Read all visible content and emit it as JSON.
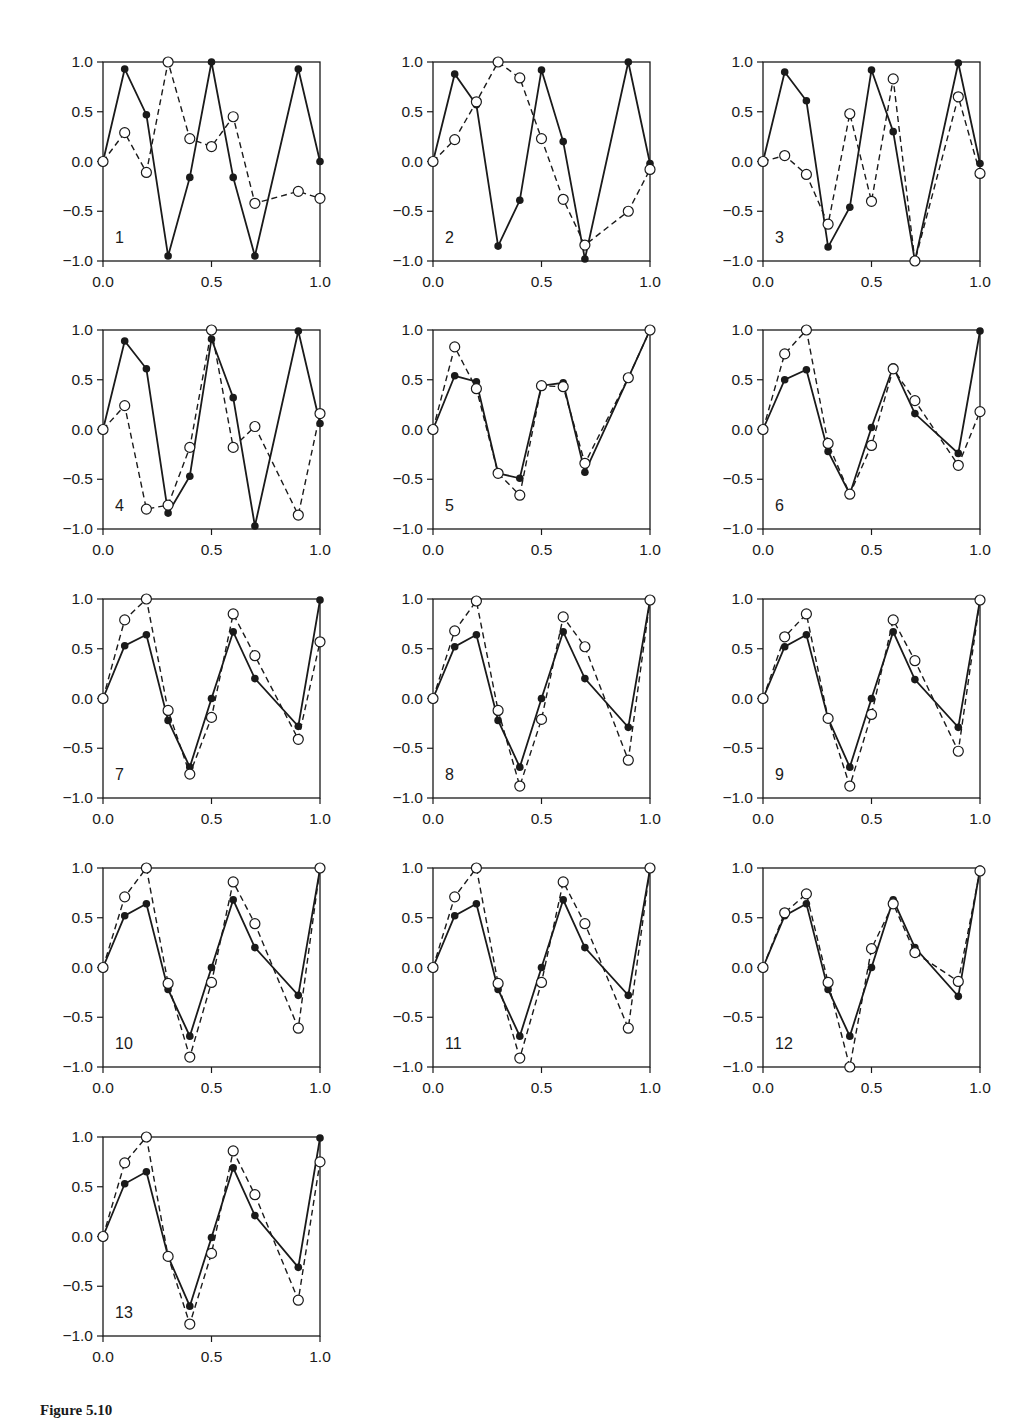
{
  "figure": {
    "caption_label": "Figure 5.10",
    "caption_text": ""
  },
  "chart_data": {
    "type": "line",
    "layout": "5 rows x 3 columns grid of small multiples (13 panels)",
    "series_styles": {
      "solid": {
        "line": "solid",
        "marker": "filled circle",
        "color": "#1a1a1a"
      },
      "dashed": {
        "line": "dashed",
        "marker": "open circle",
        "color": "#1a1a1a"
      }
    },
    "x": [
      0.0,
      0.1,
      0.2,
      0.3,
      0.4,
      0.5,
      0.6,
      0.7,
      0.9,
      1.0
    ],
    "xlim": [
      0.0,
      1.0
    ],
    "ylim": [
      -1.0,
      1.0
    ],
    "xticks": [
      "0.0",
      "0.5",
      "1.0"
    ],
    "yticks": [
      "1.0",
      "0.5",
      "0.0",
      "-0.5",
      "-1.0"
    ],
    "grid": false,
    "legend": "none",
    "panels": [
      {
        "label": "1",
        "solid": [
          0,
          0.93,
          0.47,
          -0.95,
          -0.16,
          1.0,
          -0.16,
          -0.95,
          0.93,
          0.0
        ],
        "dashed": [
          0,
          0.29,
          -0.11,
          1.0,
          0.23,
          0.15,
          0.45,
          -0.42,
          -0.3,
          -0.37
        ]
      },
      {
        "label": "2",
        "solid": [
          0,
          0.88,
          0.57,
          -0.85,
          -0.39,
          0.92,
          0.2,
          -0.98,
          1.0,
          -0.02
        ],
        "dashed": [
          0,
          0.22,
          0.6,
          1.0,
          0.84,
          0.23,
          -0.38,
          -0.84,
          -0.5,
          -0.08
        ]
      },
      {
        "label": "3",
        "solid": [
          0,
          0.9,
          0.61,
          -0.86,
          -0.46,
          0.92,
          0.3,
          -1.0,
          0.99,
          -0.02
        ],
        "dashed": [
          0,
          0.06,
          -0.13,
          -0.63,
          0.48,
          -0.4,
          0.83,
          -1.0,
          0.65,
          -0.12
        ]
      },
      {
        "label": "4",
        "solid": [
          0,
          0.89,
          0.61,
          -0.84,
          -0.47,
          0.91,
          0.32,
          -0.97,
          0.99,
          0.06
        ],
        "dashed": [
          0,
          0.24,
          -0.8,
          -0.76,
          -0.18,
          1.0,
          -0.18,
          0.03,
          -0.86,
          0.16
        ]
      },
      {
        "label": "5",
        "solid": [
          0,
          0.54,
          0.48,
          -0.44,
          -0.49,
          0.44,
          0.47,
          -0.43,
          0.52,
          1.0
        ],
        "dashed": [
          0,
          0.83,
          0.41,
          -0.44,
          -0.66,
          0.44,
          0.43,
          -0.34,
          0.52,
          1.0
        ]
      },
      {
        "label": "6",
        "solid": [
          0,
          0.5,
          0.6,
          -0.22,
          -0.65,
          0.02,
          0.63,
          0.16,
          -0.24,
          0.99
        ],
        "dashed": [
          0,
          0.76,
          1.0,
          -0.14,
          -0.65,
          -0.16,
          0.61,
          0.29,
          -0.36,
          0.18
        ]
      },
      {
        "label": "7",
        "solid": [
          0,
          0.53,
          0.64,
          -0.22,
          -0.69,
          0.0,
          0.67,
          0.2,
          -0.28,
          0.99
        ],
        "dashed": [
          0,
          0.79,
          1.0,
          -0.12,
          -0.76,
          -0.19,
          0.85,
          0.43,
          -0.41,
          0.57
        ]
      },
      {
        "label": "8",
        "solid": [
          0,
          0.52,
          0.64,
          -0.22,
          -0.69,
          0.0,
          0.67,
          0.2,
          -0.29,
          0.99
        ],
        "dashed": [
          0,
          0.68,
          0.98,
          -0.12,
          -0.88,
          -0.21,
          0.82,
          0.52,
          -0.62,
          0.99
        ]
      },
      {
        "label": "9",
        "solid": [
          0,
          0.52,
          0.64,
          -0.2,
          -0.69,
          0.0,
          0.67,
          0.19,
          -0.29,
          0.99
        ],
        "dashed": [
          0,
          0.62,
          0.85,
          -0.2,
          -0.88,
          -0.16,
          0.79,
          0.38,
          -0.53,
          0.99
        ]
      },
      {
        "label": "10",
        "solid": [
          0,
          0.52,
          0.64,
          -0.22,
          -0.69,
          0.0,
          0.68,
          0.2,
          -0.28,
          0.99
        ],
        "dashed": [
          0,
          0.71,
          1.0,
          -0.16,
          -0.9,
          -0.15,
          0.86,
          0.44,
          -0.61,
          1.0
        ]
      },
      {
        "label": "11",
        "solid": [
          0,
          0.52,
          0.64,
          -0.22,
          -0.69,
          0.0,
          0.68,
          0.2,
          -0.28,
          0.99
        ],
        "dashed": [
          0,
          0.71,
          1.0,
          -0.16,
          -0.91,
          -0.15,
          0.86,
          0.44,
          -0.61,
          1.0
        ]
      },
      {
        "label": "12",
        "solid": [
          0,
          0.52,
          0.64,
          -0.22,
          -0.69,
          0.0,
          0.68,
          0.2,
          -0.29,
          0.99
        ],
        "dashed": [
          0,
          0.55,
          0.74,
          -0.15,
          -1.0,
          0.19,
          0.64,
          0.15,
          -0.14,
          0.97
        ]
      },
      {
        "label": "13",
        "solid": [
          0,
          0.53,
          0.65,
          -0.2,
          -0.7,
          -0.01,
          0.69,
          0.21,
          -0.31,
          0.99
        ],
        "dashed": [
          0,
          0.74,
          1.0,
          -0.2,
          -0.88,
          -0.17,
          0.86,
          0.42,
          -0.64,
          0.75
        ]
      }
    ]
  }
}
